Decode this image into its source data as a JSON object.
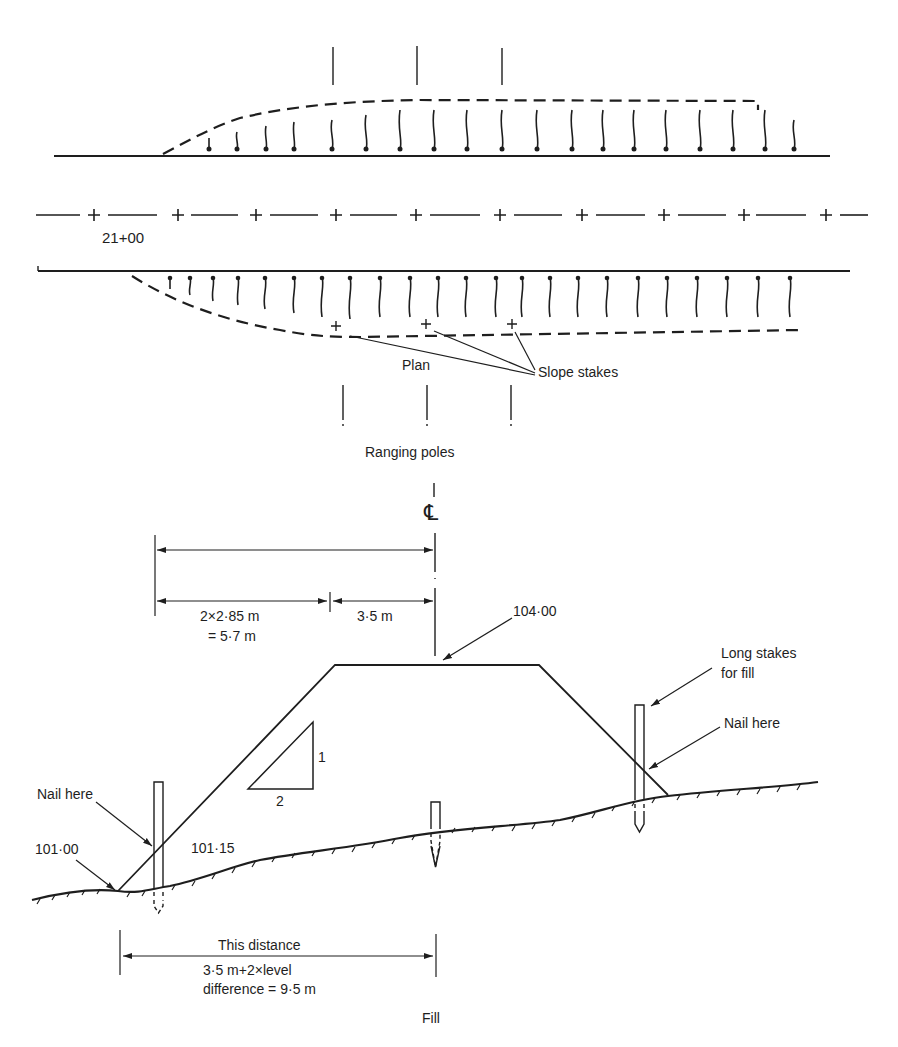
{
  "diagram": {
    "type": "engineering-drawing",
    "ink_color": "#1e1e1e",
    "background": "#ffffff"
  },
  "plan": {
    "caption": "Plan",
    "chainage_label": "21+00",
    "slope_stakes_label": "Slope stakes",
    "ranging_poles_label": "Ranging poles",
    "ranging_pole_count_top": 3,
    "ranging_pole_count_bottom": 3,
    "slope_stake_markers": 3
  },
  "section": {
    "caption": "Fill",
    "centerline_symbol": "℄",
    "top_level": "104·00",
    "toe_level": "101·00",
    "stake_level": "101·15",
    "dim_left_half": "2×2·85 m",
    "dim_left_half_result": "= 5·7 m",
    "dim_half_width": "3·5 m",
    "slope_ratio_vertical": "1",
    "slope_ratio_horizontal": "2",
    "nail_here_left": "Nail here",
    "nail_here_right": "Nail here",
    "long_stakes_line1": "Long stakes",
    "long_stakes_line2": "for fill",
    "distance_line1": "This distance",
    "distance_line2": "3·5 m+2×level",
    "distance_line3": "difference = 9·5 m"
  }
}
